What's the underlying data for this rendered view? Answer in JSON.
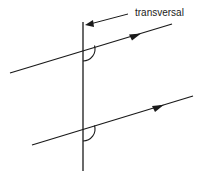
{
  "diagram": {
    "labels": {
      "transversal": "transversal"
    },
    "colors": {
      "stroke": "#1a1a1a",
      "background": "#ffffff"
    },
    "elements": {
      "transversal_line": {
        "x1": 83,
        "y1": 22,
        "x2": 83,
        "y2": 171
      },
      "label_pointer": {
        "x1": 128,
        "y1": 14,
        "x2": 85,
        "y2": 25
      },
      "parallel_line_top": {
        "x1": 10,
        "y1": 73,
        "x2": 172,
        "y2": 24,
        "arrow_at": [
          136,
          35
        ]
      },
      "parallel_line_bottom": {
        "x1": 32,
        "y1": 145,
        "x2": 193,
        "y2": 96,
        "arrow_at": [
          160,
          107
        ]
      },
      "angle_marks": [
        {
          "cx": 83,
          "cy": 49,
          "r": 12
        },
        {
          "cx": 83,
          "cy": 129,
          "r": 12
        }
      ]
    }
  }
}
